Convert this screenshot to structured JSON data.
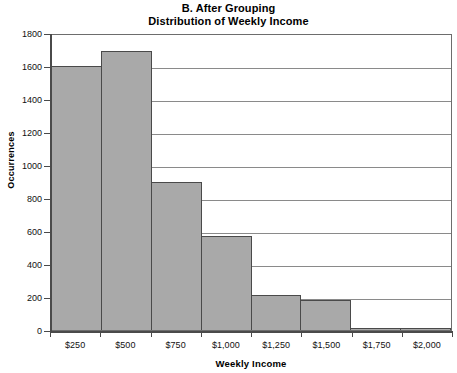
{
  "chart_data": {
    "type": "bar",
    "title": "B. After Grouping",
    "subtitle": "Distribution of Weekly Income",
    "xlabel": "Weekly Income",
    "ylabel": "Occurrences",
    "categories": [
      "$250",
      "$500",
      "$750",
      "$1,000",
      "$1,250",
      "$1,500",
      "$1,750",
      "$2,000"
    ],
    "values": [
      1600,
      1690,
      900,
      570,
      215,
      180,
      15,
      12
    ],
    "ylim": [
      0,
      1800
    ],
    "ytick_labels": [
      "1800",
      "1600",
      "1400",
      "1200",
      "1000",
      "800",
      "600",
      "400",
      "200",
      "0"
    ],
    "ytick_values": [
      1800,
      1600,
      1400,
      1200,
      1000,
      800,
      600,
      400,
      200,
      0
    ],
    "grid": true,
    "legend": "none",
    "bar_fill_color": "#a9a9a9",
    "bar_edge_color": "#4a4a4a",
    "axis_color": "#4a4a4a",
    "grid_color": "#8a8a8a",
    "background_color": "#ffffff"
  }
}
